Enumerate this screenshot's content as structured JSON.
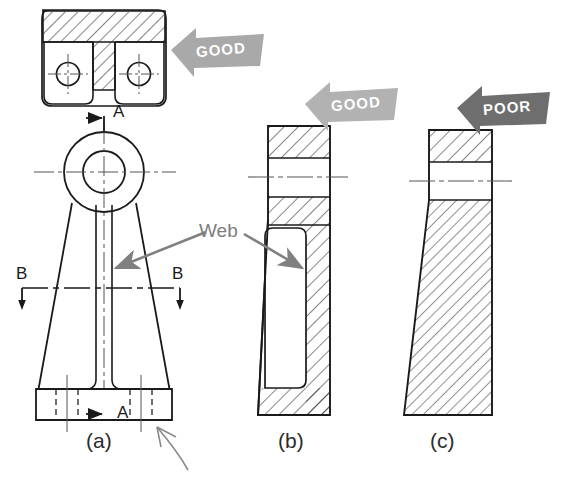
{
  "figure": {
    "captions": [
      {
        "id": "a",
        "text": "(a)",
        "x": 86,
        "y": 440
      },
      {
        "id": "b",
        "text": "(b)",
        "x": 278,
        "y": 440
      },
      {
        "id": "c",
        "text": "(c)",
        "x": 430,
        "y": 440
      }
    ],
    "annotations": {
      "web_label": "Web",
      "section_letters": [
        {
          "text": "A",
          "x": 113,
          "y": 112
        },
        {
          "text": "A",
          "x": 113,
          "y": 410
        },
        {
          "text": "B",
          "x": 22,
          "y": 275
        },
        {
          "text": "B",
          "x": 172,
          "y": 275
        }
      ]
    },
    "banners": [
      {
        "id": "good-1",
        "text": "GOOD",
        "quality": "good",
        "color": "#a9a9a9",
        "x": 168,
        "y": 30
      },
      {
        "id": "good-2",
        "text": "GOOD",
        "quality": "good",
        "color": "#b2b2b2",
        "x": 303,
        "y": 84
      },
      {
        "id": "poor-1",
        "text": "POOR",
        "quality": "poor",
        "color": "#6e6e6e",
        "x": 455,
        "y": 88
      }
    ],
    "colors": {
      "line": "#1a1a1a",
      "hatch": "#2b2b2b",
      "center_line": "#555555",
      "annotation_gray": "#7d7d7d",
      "pencil": "#8a8a8a",
      "background": "#ffffff"
    },
    "views": [
      {
        "id": "section-bb",
        "name": "Section B-B top view",
        "hatched": true
      },
      {
        "id": "front-view-a",
        "name": "Front view with web",
        "hatched": false
      },
      {
        "id": "side-view-b",
        "name": "Side section good thin web",
        "hatched": true
      },
      {
        "id": "side-view-c",
        "name": "Side section poor solid",
        "hatched": true
      }
    ]
  }
}
